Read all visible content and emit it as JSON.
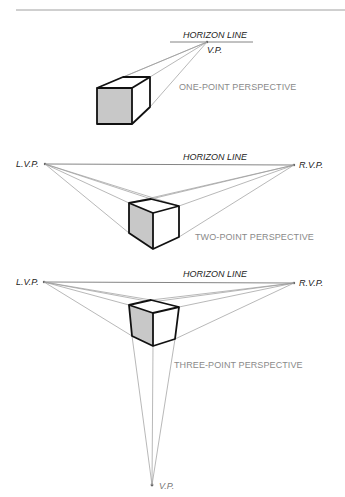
{
  "diagram": {
    "colors": {
      "edge": "#111111",
      "guide": "#9a9a9a",
      "shaded_face": "#c8c8c8",
      "label": "#8a8a8a"
    },
    "one_point": {
      "horizon_label": "HORIZON LINE",
      "vp_label": "V.P.",
      "caption": "ONE-POINT PERSPECTIVE"
    },
    "two_point": {
      "horizon_label": "HORIZON LINE",
      "left_vp_label": "L.V.P.",
      "right_vp_label": "R.V.P.",
      "caption": "TWO-POINT PERSPECTIVE"
    },
    "three_point": {
      "horizon_label": "HORIZON LINE",
      "left_vp_label": "L.V.P.",
      "right_vp_label": "R.V.P.",
      "bottom_vp_label": "V.P.",
      "caption": "THREE-POINT PERSPECTIVE"
    }
  }
}
